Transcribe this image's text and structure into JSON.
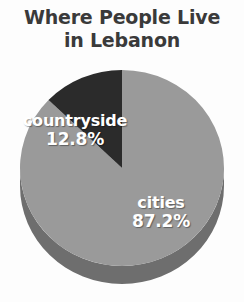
{
  "title": {
    "line1": "Where People Live",
    "line2": "in Lebanon"
  },
  "colors": {
    "background": "#fdfdfd",
    "title_text": "#3a3a3a",
    "label_text": "#ffffff",
    "cities_top": "#9a9a9a",
    "cities_side": "#6e6e6e",
    "countryside_top": "#2b2b2b",
    "countryside_side": "#1a1a1a"
  },
  "chart_data": {
    "type": "pie",
    "title": "Where People Live in Lebanon",
    "subtitle": "",
    "xlabel": "",
    "ylabel": "",
    "legend_position": "none",
    "grid": false,
    "three_d": true,
    "labels": [
      "cities",
      "countryside"
    ],
    "values": [
      87.2,
      12.8
    ],
    "value_suffix": "%",
    "slices": [
      {
        "label": "cities",
        "value": 87.2,
        "value_text": "87.2%",
        "color": "#9a9a9a",
        "side_color": "#6e6e6e",
        "start_angle_deg": 0,
        "end_angle_deg": 313.9,
        "label_x": 161,
        "label_y": 203
      },
      {
        "label": "countryside",
        "value": 12.8,
        "value_text": "12.8%",
        "color": "#2b2b2b",
        "side_color": "#1a1a1a",
        "start_angle_deg": 313.9,
        "end_angle_deg": 360,
        "label_x": 75,
        "label_y": 123
      }
    ],
    "geometry": {
      "center_x": 122,
      "center_y": 168,
      "radius_x": 102,
      "radius_y": 98,
      "depth": 18
    }
  },
  "labels": {
    "cities": {
      "name": "cities",
      "value": "87.2%"
    },
    "countryside": {
      "name": "countryside",
      "value": "12.8%"
    }
  }
}
